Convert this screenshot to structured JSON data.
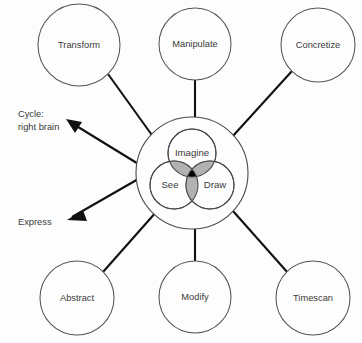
{
  "diagram": {
    "title_visible": false,
    "background_color": "#fdfdfd",
    "core": {
      "ring_label": "outer-ring",
      "venn": {
        "circles": [
          {
            "id": "imagine",
            "label": "Imagine",
            "cx": 192,
            "cy": 153,
            "r": 24
          },
          {
            "id": "see",
            "label": "See",
            "cx": 174,
            "cy": 185,
            "r": 24
          },
          {
            "id": "draw",
            "label": "Draw",
            "cx": 210,
            "cy": 185,
            "r": 24
          }
        ],
        "pair_overlap_color": "#b2b2b2",
        "triple_overlap_color": "#000000",
        "stroke_color": "#4a4a4a"
      },
      "ring": {
        "cx": 192,
        "cy": 173,
        "r": 56,
        "stroke_color": "#4a4a4a"
      }
    },
    "satellites": [
      {
        "id": "transform",
        "label": "Transform",
        "cx": 79,
        "cy": 45,
        "r": 41
      },
      {
        "id": "manipulate",
        "label": "Manipulate",
        "cx": 195,
        "cy": 44,
        "r": 36
      },
      {
        "id": "concretize",
        "label": "Concretize",
        "cx": 318,
        "cy": 45,
        "r": 37
      },
      {
        "id": "abstract",
        "label": "Abstract",
        "cx": 77,
        "cy": 298,
        "r": 37
      },
      {
        "id": "modify",
        "label": "Modify",
        "cx": 195,
        "cy": 297,
        "r": 36
      },
      {
        "id": "timescan",
        "label": "Timescan",
        "cx": 313,
        "cy": 298,
        "r": 37
      }
    ],
    "annotations": [
      {
        "id": "cycle-right-brain",
        "line1": "Cycle:",
        "line2": "right brain",
        "x": 18,
        "y": 117
      },
      {
        "id": "express",
        "line1": "Express",
        "line2": "",
        "x": 18,
        "y": 225
      }
    ],
    "connector_color": "#111111",
    "text_color": "#3a3a3a"
  }
}
